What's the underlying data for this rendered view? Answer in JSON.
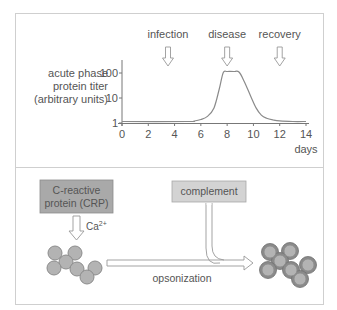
{
  "chart_data": {
    "type": "line",
    "title": "",
    "ylabel": "acute phase protein titer (arbitrary units)",
    "ylabel_lines": [
      "acute phase",
      "protein titer",
      "(arbitrary units)"
    ],
    "xlabel": "days",
    "x_ticks": [
      0,
      2,
      4,
      6,
      8,
      10,
      12,
      14
    ],
    "y_ticks": [
      {
        "value": 1,
        "label": "1"
      },
      {
        "value": 10,
        "label": "10"
      },
      {
        "value": 100,
        "label": "100"
      }
    ],
    "y_scale": "log",
    "xlim": [
      0,
      14
    ],
    "ylim": [
      1,
      100
    ],
    "grid": false,
    "series": [
      {
        "name": "acute phase protein titer",
        "x": [
          0,
          5.0,
          5.5,
          6.0,
          6.5,
          7.0,
          7.4,
          7.7,
          8.0,
          8.5,
          8.9,
          9.3,
          9.8,
          10.2,
          10.6,
          11.0,
          11.5,
          12.0,
          13.0,
          14.0
        ],
        "y": [
          1.0,
          1.0,
          1.05,
          1.2,
          1.6,
          3.5,
          20,
          90,
          100,
          100,
          95,
          40,
          10,
          3.5,
          1.8,
          1.35,
          1.15,
          1.05,
          1.0,
          1.0
        ]
      }
    ],
    "annotations": [
      {
        "label": "infection",
        "day": 3.5
      },
      {
        "label": "disease",
        "day": 8
      },
      {
        "label": "recovery",
        "day": 12
      }
    ]
  },
  "diagram": {
    "crp_box": {
      "line1": "C-reactive",
      "line2": "protein (CRP)",
      "color": "#a9a9a9"
    },
    "complement_box": {
      "label": "complement",
      "color": "#d3d3d3"
    },
    "calcium_label": {
      "base": "Ca",
      "superscript": "2+"
    },
    "process_label": "opsonization",
    "bacteria_color": "#b3b3b3",
    "opsonized_ring_color": "#8a8a8a"
  }
}
